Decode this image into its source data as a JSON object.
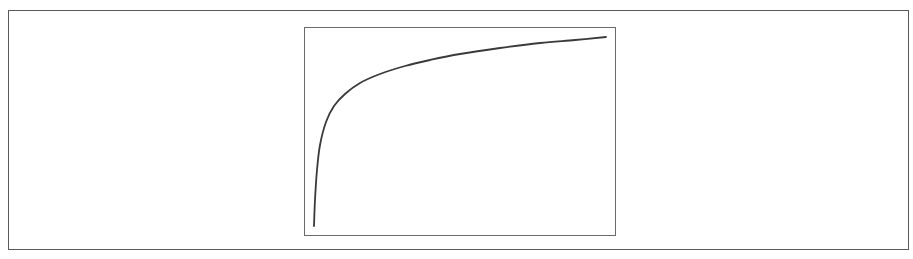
{
  "diagram": {
    "type": "logarithmic-growth-curve",
    "frame": {
      "stroke": "#5a5a5a"
    },
    "plot_box": {
      "stroke": "#6a6a6a"
    },
    "curve": {
      "stroke": "#3a3a3a",
      "points": [
        [
          314,
          226
        ],
        [
          315,
          200
        ],
        [
          317,
          170
        ],
        [
          320,
          145
        ],
        [
          326,
          122
        ],
        [
          334,
          106
        ],
        [
          345,
          94
        ],
        [
          360,
          83
        ],
        [
          380,
          74
        ],
        [
          405,
          66
        ],
        [
          430,
          60
        ],
        [
          460,
          54
        ],
        [
          500,
          48
        ],
        [
          540,
          43
        ],
        [
          575,
          40
        ],
        [
          606,
          37
        ]
      ]
    }
  },
  "chart_data": {
    "type": "line",
    "title": "",
    "xlabel": "",
    "ylabel": "",
    "grid": false,
    "legend": null,
    "series": [
      {
        "name": "curve",
        "x": [
          0.0,
          0.003,
          0.01,
          0.02,
          0.04,
          0.065,
          0.1,
          0.15,
          0.22,
          0.3,
          0.38,
          0.48,
          0.61,
          0.74,
          0.85,
          0.95
        ],
        "y": [
          0.05,
          0.17,
          0.32,
          0.44,
          0.55,
          0.63,
          0.68,
          0.74,
          0.78,
          0.82,
          0.85,
          0.87,
          0.9,
          0.93,
          0.94,
          0.95
        ]
      }
    ],
    "xlim": [
      0,
      1
    ],
    "ylim": [
      0,
      1
    ]
  }
}
